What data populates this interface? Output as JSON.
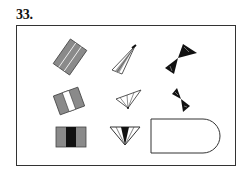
{
  "problem": {
    "number": "33."
  },
  "matrix": {
    "rows": 3,
    "cols": 3,
    "cells": [
      {
        "row": 1,
        "col": 1,
        "shape": "tilted-rectangle-three-gray-stripes",
        "fill": "#8a8a8a"
      },
      {
        "row": 1,
        "col": 2,
        "shape": "narrow-fan-triangle-outline",
        "fill": "#9a9a9a"
      },
      {
        "row": 1,
        "col": 3,
        "shape": "black-bowtie-tilted",
        "fill": "#111111"
      },
      {
        "row": 2,
        "col": 1,
        "shape": "tilted-rectangle-two-gray-stripes-white-center",
        "fill": "#8a8a8a"
      },
      {
        "row": 2,
        "col": 2,
        "shape": "wide-fan-triangle-outline",
        "fill": "#ffffff"
      },
      {
        "row": 2,
        "col": 3,
        "shape": "small-black-bowtie-tilted",
        "fill": "#111111"
      },
      {
        "row": 3,
        "col": 1,
        "shape": "rectangle-gray-black-gray-stripes",
        "fill": "#8a8a8a"
      },
      {
        "row": 3,
        "col": 2,
        "shape": "inverted-triangle-black-center",
        "fill": "#111111"
      },
      {
        "row": 3,
        "col": 3,
        "shape": "answer-placeholder-rounded",
        "fill": "#ffffff"
      }
    ]
  },
  "colors": {
    "stroke": "#333333",
    "gray": "#8a8a8a",
    "black": "#111111"
  }
}
